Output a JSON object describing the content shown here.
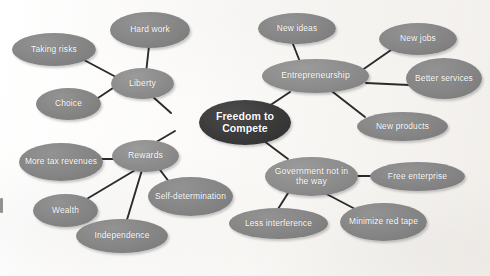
{
  "diagram": {
    "type": "mind-map",
    "background_color": "#fbfaf8",
    "edge_color": "#2b2b2b",
    "center_color": "#363636",
    "hub_color": "#8c8c8c",
    "leaf_color": "#858585",
    "text_color": "#ffffff"
  },
  "nodes": {
    "center": {
      "label": "Freedom to Compete",
      "x": 199,
      "y": 100,
      "w": 92,
      "h": 45
    },
    "liberty": {
      "label": "Liberty",
      "x": 111,
      "y": 68,
      "w": 63,
      "h": 31
    },
    "entrepreneurship": {
      "label": "Entrepreneurship",
      "x": 262,
      "y": 59,
      "w": 107,
      "h": 34
    },
    "rewards": {
      "label": "Rewards",
      "x": 112,
      "y": 140,
      "w": 67,
      "h": 32
    },
    "government": {
      "label": "Government not in the way",
      "x": 265,
      "y": 157,
      "w": 93,
      "h": 39
    },
    "taking_risks": {
      "label": "Taking risks",
      "x": 12,
      "y": 33,
      "w": 84,
      "h": 33
    },
    "hard_work": {
      "label": "Hard work",
      "x": 110,
      "y": 12,
      "w": 80,
      "h": 36
    },
    "choice": {
      "label": "Choice",
      "x": 36,
      "y": 88,
      "w": 65,
      "h": 32
    },
    "new_ideas": {
      "label": "New ideas",
      "x": 258,
      "y": 13,
      "w": 78,
      "h": 31
    },
    "new_jobs": {
      "label": "New jobs",
      "x": 379,
      "y": 23,
      "w": 78,
      "h": 32
    },
    "better_services": {
      "label": "Better services",
      "x": 406,
      "y": 58,
      "w": 76,
      "h": 41
    },
    "new_products": {
      "label": "New products",
      "x": 357,
      "y": 112,
      "w": 91,
      "h": 29
    },
    "more_tax_revenues": {
      "label": "More tax revenues",
      "x": 19,
      "y": 143,
      "w": 84,
      "h": 38
    },
    "self_determination": {
      "label": "Self-determination",
      "x": 148,
      "y": 177,
      "w": 85,
      "h": 39
    },
    "wealth": {
      "label": "Wealth",
      "x": 33,
      "y": 194,
      "w": 65,
      "h": 33
    },
    "independence": {
      "label": "Independence",
      "x": 76,
      "y": 219,
      "w": 92,
      "h": 34
    },
    "free_enterprise": {
      "label": "Free enterprise",
      "x": 370,
      "y": 162,
      "w": 95,
      "h": 29
    },
    "less_interference": {
      "label": "Less interference",
      "x": 229,
      "y": 208,
      "w": 99,
      "h": 31
    },
    "minimize_red_tape": {
      "label": "Minimize red tape",
      "x": 340,
      "y": 203,
      "w": 87,
      "h": 38
    }
  },
  "edges": [
    {
      "from": "center",
      "to": "liberty",
      "x1": 171,
      "y1": 113,
      "x2": 143,
      "y2": 88
    },
    {
      "from": "center",
      "to": "entrepreneurship",
      "x1": 263,
      "y1": 110,
      "x2": 290,
      "y2": 92
    },
    {
      "from": "center",
      "to": "rewards",
      "x1": 175,
      "y1": 131,
      "x2": 146,
      "y2": 148
    },
    {
      "from": "center",
      "to": "government",
      "x1": 256,
      "y1": 135,
      "x2": 288,
      "y2": 159
    },
    {
      "from": "liberty",
      "to": "taking_risks",
      "x1": 116,
      "y1": 77,
      "x2": 84,
      "y2": 60
    },
    {
      "from": "liberty",
      "to": "hard_work",
      "x1": 146,
      "y1": 73,
      "x2": 149,
      "y2": 46
    },
    {
      "from": "liberty",
      "to": "choice",
      "x1": 113,
      "y1": 88,
      "x2": 92,
      "y2": 102
    },
    {
      "from": "entrepreneurship",
      "to": "new_ideas",
      "x1": 304,
      "y1": 72,
      "x2": 293,
      "y2": 44
    },
    {
      "from": "entrepreneurship",
      "to": "new_jobs",
      "x1": 358,
      "y1": 73,
      "x2": 391,
      "y2": 50
    },
    {
      "from": "entrepreneurship",
      "to": "better_services",
      "x1": 366,
      "y1": 83,
      "x2": 409,
      "y2": 85
    },
    {
      "from": "entrepreneurship",
      "to": "new_products",
      "x1": 329,
      "y1": 89,
      "x2": 365,
      "y2": 117
    },
    {
      "from": "rewards",
      "to": "more_tax_revenues",
      "x1": 114,
      "y1": 159,
      "x2": 95,
      "y2": 159
    },
    {
      "from": "rewards",
      "to": "wealth",
      "x1": 137,
      "y1": 169,
      "x2": 80,
      "y2": 203
    },
    {
      "from": "rewards",
      "to": "independence",
      "x1": 142,
      "y1": 170,
      "x2": 126,
      "y2": 223
    },
    {
      "from": "rewards",
      "to": "self_determination",
      "x1": 157,
      "y1": 166,
      "x2": 170,
      "y2": 183
    },
    {
      "from": "government",
      "to": "free_enterprise",
      "x1": 344,
      "y1": 176,
      "x2": 378,
      "y2": 176
    },
    {
      "from": "government",
      "to": "less_interference",
      "x1": 290,
      "y1": 190,
      "x2": 278,
      "y2": 209
    },
    {
      "from": "government",
      "to": "minimize_red_tape",
      "x1": 317,
      "y1": 189,
      "x2": 357,
      "y2": 210
    }
  ]
}
